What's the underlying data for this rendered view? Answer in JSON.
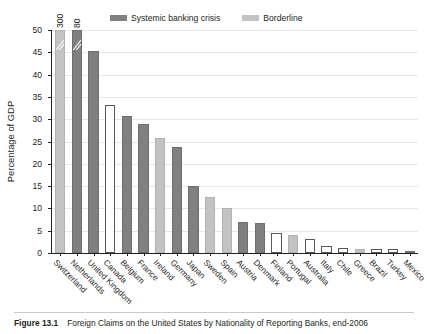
{
  "figure": {
    "caption_label": "Figure 13.1",
    "caption_text": "Foreign Claims on the United States by Nationality of Reporting Banks, end-2006"
  },
  "legend": {
    "position": "top-center",
    "entries": [
      {
        "label": "Systemic banking crisis",
        "color": "#808082",
        "key": "systemic"
      },
      {
        "label": "Borderline",
        "color": "#c3c3c5",
        "key": "borderline"
      },
      {
        "label": "No crisis",
        "color": "#ffffff",
        "key": "none"
      }
    ]
  },
  "chart_data": {
    "type": "bar",
    "title": "Foreign Claims on the United States by Nationality of Reporting Banks, end-2006",
    "xlabel": "",
    "ylabel": "Percentage of GDP",
    "ylim": [
      0,
      50
    ],
    "yticks": [
      0,
      5,
      10,
      15,
      20,
      25,
      30,
      35,
      40,
      45,
      50
    ],
    "ytick_labels": [
      "0",
      "5",
      "10",
      "15",
      "20",
      "25",
      "30",
      "35",
      "40",
      "45",
      "50"
    ],
    "grid": true,
    "axis_break_note": "First two bars exceed the axis maximum and are truncated with break marks; true values shown as data labels.",
    "categories": [
      "Switzerland",
      "Netherlands",
      "United Kingdom",
      "Canada",
      "Belgium",
      "France",
      "Ireland",
      "Germany",
      "Japan",
      "Sweden",
      "Spain",
      "Austria",
      "Denmark",
      "Finland",
      "Portugal",
      "Australia",
      "Italy",
      "Chile",
      "Greece",
      "Brazil",
      "Turkey",
      "Mexico"
    ],
    "values": [
      300,
      80,
      45.2,
      33.1,
      30.8,
      28.9,
      25.7,
      23.7,
      15.1,
      12.6,
      10.0,
      6.9,
      6.7,
      4.5,
      4.1,
      3.1,
      1.6,
      1.1,
      0.8,
      1.0,
      1.0,
      0.4
    ],
    "display_heights": [
      50,
      50,
      45.2,
      33.1,
      30.8,
      28.9,
      25.7,
      23.7,
      15.1,
      12.6,
      10.0,
      6.9,
      6.7,
      4.5,
      4.1,
      3.1,
      1.6,
      1.1,
      0.8,
      1.0,
      1.0,
      0.4
    ],
    "data_labels": [
      "300",
      "80",
      "",
      "",
      "",
      "",
      "",
      "",
      "",
      "",
      "",
      "",
      "",
      "",
      "",
      "",
      "",
      "",
      "",
      "",
      "",
      ""
    ],
    "truncated": [
      true,
      true,
      false,
      false,
      false,
      false,
      false,
      false,
      false,
      false,
      false,
      false,
      false,
      false,
      false,
      false,
      false,
      false,
      false,
      false,
      false,
      false
    ],
    "crisis_status": [
      "borderline",
      "systemic",
      "systemic",
      "none",
      "systemic",
      "systemic",
      "borderline",
      "systemic",
      "systemic",
      "borderline",
      "borderline",
      "systemic",
      "systemic",
      "none",
      "borderline",
      "none",
      "none",
      "none",
      "borderline",
      "none",
      "none",
      "systemic"
    ],
    "series": [
      {
        "name": "Foreign claims on the United States",
        "values": [
          300,
          80,
          45.2,
          33.1,
          30.8,
          28.9,
          25.7,
          23.7,
          15.1,
          12.6,
          10.0,
          6.9,
          6.7,
          4.5,
          4.1,
          3.1,
          1.6,
          1.1,
          0.8,
          1.0,
          1.0,
          0.4
        ]
      }
    ]
  }
}
